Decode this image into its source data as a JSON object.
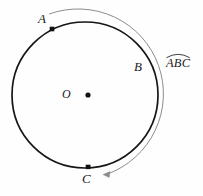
{
  "figure": {
    "type": "geometry-diagram",
    "background_color": "#fefefe",
    "canvas": {
      "width": 203,
      "height": 196
    }
  },
  "circle": {
    "name": "main-circle",
    "center": {
      "x": 85,
      "y": 95,
      "label": "O"
    },
    "radius": 73,
    "stroke_color": "#161616",
    "stroke_width": 1.6,
    "fill": "none"
  },
  "center_marker": {
    "label": "O",
    "dot_x": 88,
    "dot_y": 95,
    "dot_radius": 2.6,
    "color": "#111111"
  },
  "points": [
    {
      "id": "A",
      "label": "A",
      "x": 52,
      "y": 29,
      "has_marker": true,
      "marker_shape": "square",
      "marker_size": 4.4,
      "label_x": 38,
      "label_y": 12,
      "color": "#111111"
    },
    {
      "id": "B",
      "label": "B",
      "x": 156,
      "y": 68,
      "has_marker": false,
      "label_x": 134,
      "label_y": 60,
      "color": "#111111"
    },
    {
      "id": "C",
      "label": "C",
      "x": 88,
      "y": 167,
      "has_marker": true,
      "marker_shape": "square",
      "marker_size": 4.4,
      "label_x": 82,
      "label_y": 172,
      "color": "#111111"
    }
  ],
  "outer_arc": {
    "name": "arc-ABC-indicator",
    "description": "thin arc outside the circle sweeping clockwise from near A over B down to C, ending in an arrowhead pointing at C",
    "offset_from_circle": 11,
    "radius": 84,
    "start_angle_deg": -115,
    "end_angle_deg": 88,
    "sweep": "clockwise",
    "stroke_color": "#8c8c8c",
    "stroke_width": 1.0,
    "arrowhead": {
      "x": 104,
      "y": 175,
      "direction": "left",
      "color": "#8c8c8c"
    }
  },
  "arc_label": {
    "text": "ABC",
    "notation": "arc",
    "overline_symbol": "⌒",
    "x": 166,
    "y": 57,
    "color": "#1a1a1a"
  }
}
